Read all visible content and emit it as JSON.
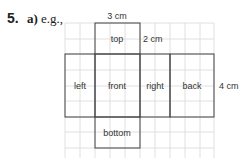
{
  "question": {
    "number": "5.",
    "part": "a)",
    "prefix": "e.g.,"
  },
  "net": {
    "faces": [
      {
        "name": "top",
        "label": "top"
      },
      {
        "name": "left",
        "label": "left"
      },
      {
        "name": "front",
        "label": "front"
      },
      {
        "name": "right",
        "label": "right"
      },
      {
        "name": "back",
        "label": "back"
      },
      {
        "name": "bottom",
        "label": "bottom"
      }
    ],
    "dimensions": {
      "width": "3 cm",
      "depth": "2 cm",
      "height": "4 cm"
    }
  }
}
